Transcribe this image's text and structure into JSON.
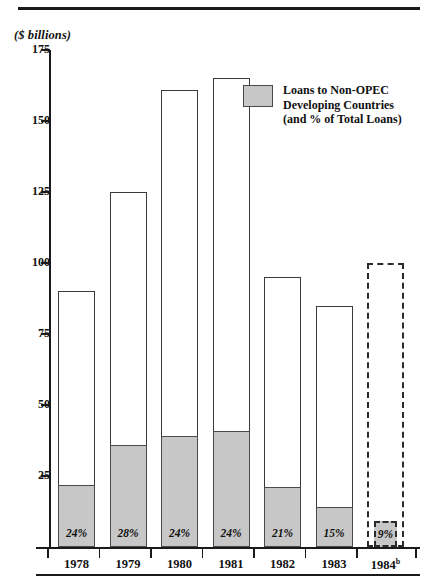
{
  "chart_data": {
    "type": "bar",
    "title": "($ billions)",
    "xlabel": "",
    "ylabel": "($ billions)",
    "ylim": [
      0,
      175
    ],
    "yticks": [
      175,
      150,
      125,
      100,
      75,
      50,
      25
    ],
    "grid": false,
    "legend_position": "upper-right",
    "categories": [
      "1978",
      "1979",
      "1980",
      "1981",
      "1982",
      "1983",
      "1984"
    ],
    "category_labels": [
      "1978",
      "1979",
      "1980",
      "1981",
      "1982",
      "1983",
      "1984"
    ],
    "category_superscripts": [
      "",
      "",
      "",
      "",
      "",
      "",
      "b"
    ],
    "series": [
      {
        "name": "Total Loans",
        "values": [
          90,
          125,
          161,
          165,
          95,
          85,
          100
        ]
      },
      {
        "name": "Loans to Non-OPEC Developing Countries",
        "values": [
          22,
          36,
          39,
          41,
          21,
          14,
          9
        ]
      }
    ],
    "segment_percent_labels": [
      "24%",
      "28%",
      "24%",
      "24%",
      "21%",
      "15%",
      "9%"
    ],
    "projected_categories": [
      "1984"
    ]
  },
  "legend": {
    "swatch_name": "shaded-swatch",
    "line1": "Loans to Non-OPEC",
    "line2": "Developing Countries",
    "line3": "(and % of Total Loans)"
  },
  "axis": {
    "unit_label": "($ billions)",
    "ytick_labels": [
      "175",
      "150",
      "125",
      "100",
      "75",
      "50",
      "25"
    ]
  },
  "colors": {
    "shaded_fill": "#c7c7c7",
    "bar_outline": "#3a3a3a",
    "axis": "#1a1a1a",
    "background": "#ffffff"
  }
}
